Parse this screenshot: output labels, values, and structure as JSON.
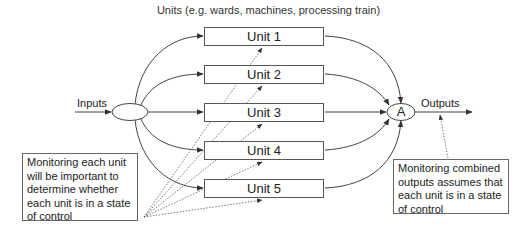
{
  "diagram": {
    "title": "Units (e.g. wards, machines, processing train)",
    "input_label": "Inputs",
    "output_label": "Outputs",
    "aggregate_node_label": "A",
    "units": [
      {
        "label": "Unit 1"
      },
      {
        "label": "Unit 2"
      },
      {
        "label": "Unit 3"
      },
      {
        "label": "Unit 4"
      },
      {
        "label": "Unit 5"
      }
    ],
    "notes": {
      "left": "Monitoring each unit will be important to determine whether each unit is in a state of control",
      "right": "Monitoring combined outputs assumes that each unit is in a state of control"
    },
    "colors": {
      "line": "#444444",
      "box_border": "#555555",
      "text": "#222222",
      "background": "#ffffff"
    }
  }
}
